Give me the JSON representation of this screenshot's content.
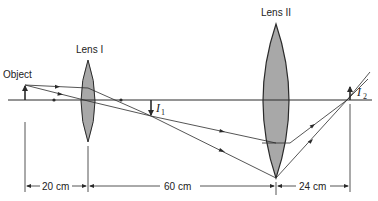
{
  "diagram": {
    "labels": {
      "object": "Object",
      "lens1": "Lens I",
      "lens2": "Lens II",
      "image1": "I",
      "image1_sub": "1",
      "image2": "I",
      "image2_sub": "2"
    },
    "dimensions": [
      {
        "label": "20 cm",
        "from": "object",
        "to": "lens1"
      },
      {
        "label": "60 cm",
        "from": "lens1",
        "to": "lens2"
      },
      {
        "label": "24 cm",
        "from": "lens2",
        "to": "image2"
      }
    ],
    "colors": {
      "line": "#2a2a2a",
      "lens_fill": "#a8a8a8",
      "background": "#ffffff"
    }
  }
}
